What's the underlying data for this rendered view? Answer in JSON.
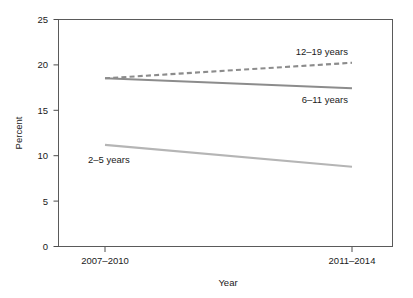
{
  "chart_data": {
    "type": "line",
    "title": "",
    "subtitle": "",
    "xlabel": "Year",
    "ylabel": "Percent",
    "categories": [
      "2007–2010",
      "2011–2014"
    ],
    "x": [
      0,
      1
    ],
    "xlim": [
      -0.19,
      1.17
    ],
    "ylim": [
      0,
      25
    ],
    "ytick_labels": [
      "0",
      "5",
      "10",
      "15",
      "20",
      "25"
    ],
    "ytick_values": [
      0,
      5,
      10,
      15,
      20,
      25
    ],
    "xtick_labels": [
      "2007–2010",
      "2011–2014"
    ],
    "grid": false,
    "legend_position": "inline-annotations",
    "series": [
      {
        "name": "12–19 years",
        "label": "12–19 years",
        "values": [
          18.5,
          20.2
        ],
        "style": "dashed",
        "color": "#8c8c8c",
        "width": 2.1,
        "label_x": 348,
        "label_y": 55,
        "label_anchor": "end"
      },
      {
        "name": "6–11 years",
        "label": "6–11 years",
        "values": [
          18.5,
          17.4
        ],
        "style": "solid",
        "color": "#8c8c8c",
        "width": 2.1,
        "label_x": 348,
        "label_y": 103,
        "label_anchor": "end"
      },
      {
        "name": "2–5 years",
        "label": "2–5 years",
        "values": [
          11.2,
          8.8
        ],
        "style": "solid",
        "color": "#b5b5b5",
        "width": 2.1,
        "label_x": 88,
        "label_y": 163,
        "label_anchor": "start"
      }
    ],
    "axis_geometry": {
      "left": 58,
      "right": 393,
      "top": 19,
      "bottom": 247,
      "x_tick_pixels": [
        105,
        352
      ]
    },
    "colors": {
      "axis": "#4d4d4d",
      "frame": "#5a5a5a",
      "text": "#1a1a1a",
      "background": "#ffffff",
      "series_dark": "#8c8c8c",
      "series_light": "#b5b5b5"
    }
  }
}
